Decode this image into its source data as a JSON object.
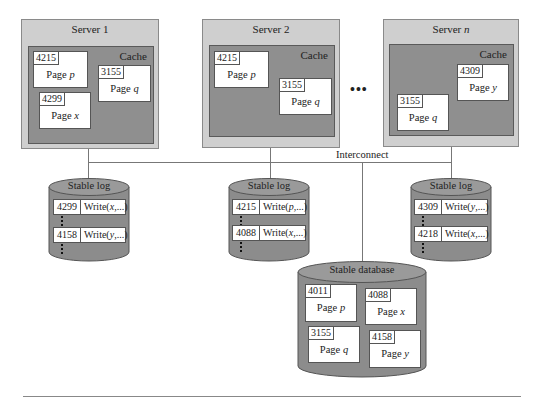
{
  "diagram": {
    "servers": [
      {
        "title": "Server 1",
        "cache_label": "Cache",
        "pages": [
          {
            "lsn": "4215",
            "label": "Page",
            "var": "p"
          },
          {
            "lsn": "3155",
            "label": "Page",
            "var": "q"
          },
          {
            "lsn": "4299",
            "label": "Page",
            "var": "x"
          }
        ]
      },
      {
        "title": "Server 2",
        "cache_label": "Cache",
        "pages": [
          {
            "lsn": "4215",
            "label": "Page",
            "var": "p"
          },
          {
            "lsn": "3155",
            "label": "Page",
            "var": "q"
          }
        ]
      },
      {
        "title": "Server",
        "title_var": "n",
        "cache_label": "Cache",
        "pages": [
          {
            "lsn": "4309",
            "label": "Page",
            "var": "y"
          },
          {
            "lsn": "3155",
            "label": "Page",
            "var": "q"
          }
        ]
      }
    ],
    "ellipsis": "•••",
    "interconnect_label": "Interconnect",
    "stable_logs": [
      {
        "title": "Stable log",
        "entries": [
          {
            "lsn": "4299",
            "op": "Write(",
            "var": "x",
            "rest": ",...)"
          },
          {
            "lsn": "4158",
            "op": "Write(",
            "var": "y",
            "rest": ",...)"
          }
        ]
      },
      {
        "title": "Stable log",
        "entries": [
          {
            "lsn": "4215",
            "op": "Write(",
            "var": "p",
            "rest": ",...)"
          },
          {
            "lsn": "4088",
            "op": "Write(",
            "var": "x",
            "rest": ",...)"
          }
        ]
      },
      {
        "title": "Stable log",
        "entries": [
          {
            "lsn": "4309",
            "op": "Write(",
            "var": "y",
            "rest": ",...)"
          },
          {
            "lsn": "4218",
            "op": "Write(",
            "var": "x",
            "rest": ",...)"
          }
        ]
      }
    ],
    "stable_database": {
      "title": "Stable database",
      "pages": [
        {
          "lsn": "4011",
          "label": "Page",
          "var": "p"
        },
        {
          "lsn": "4088",
          "label": "Page",
          "var": "x"
        },
        {
          "lsn": "3155",
          "label": "Page",
          "var": "q"
        },
        {
          "lsn": "4158",
          "label": "Page",
          "var": "y"
        }
      ]
    },
    "colors": {
      "server_bg": "#cfcfcf",
      "cache_bg": "#8f8f8f",
      "cylinder_body": "#8c8c8c",
      "cylinder_top": "#9a9a9a",
      "line": "#777777"
    }
  }
}
